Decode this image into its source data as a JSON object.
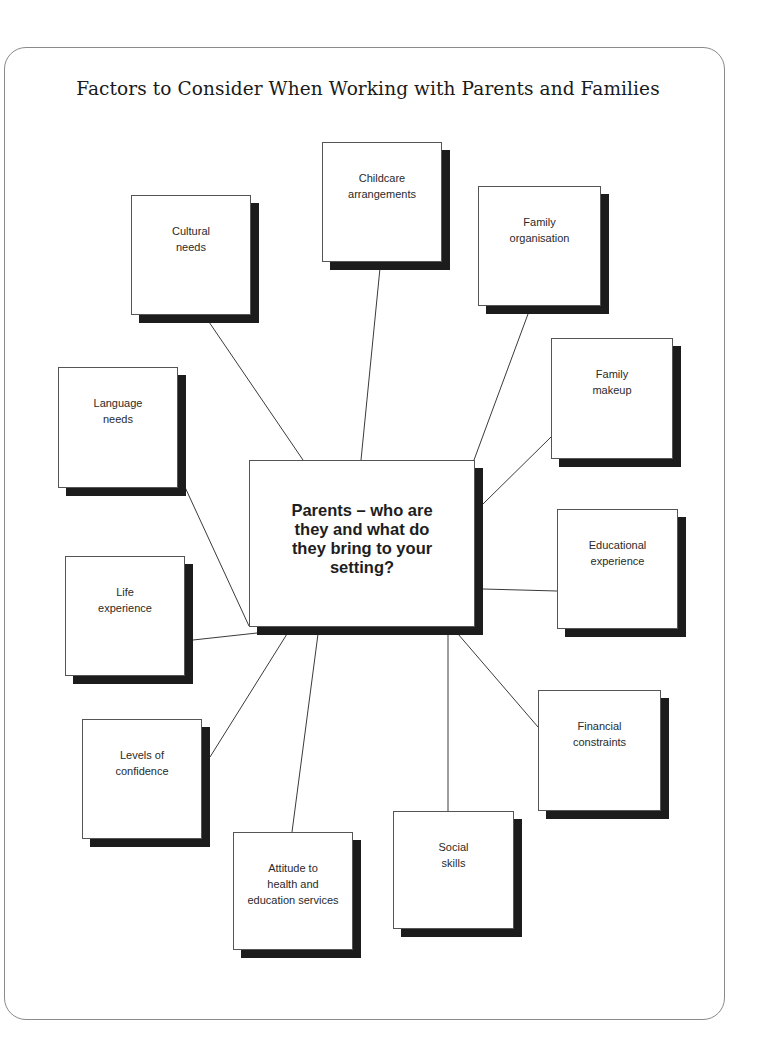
{
  "title": "Factors to Consider When Working with Parents and Families",
  "colors": {
    "line": "#3a3a3a",
    "shadow": "#1c1c1c",
    "frame": "#8a8a8a",
    "box_fill": "#ffffff"
  },
  "center": {
    "label": "Parents – who are\nthey and what do\nthey bring to your\nsetting?",
    "rect": [
      249,
      460,
      226,
      167
    ]
  },
  "factors": [
    {
      "id": "childcare-arrangements",
      "label": "Childcare\narrangements",
      "rect": [
        322,
        142,
        120,
        120
      ],
      "line": [
        380,
        268,
        361,
        460
      ]
    },
    {
      "id": "cultural-needs",
      "label": "Cultural\nneeds",
      "rect": [
        131,
        195,
        120,
        120
      ],
      "line": [
        209,
        322,
        303,
        460
      ]
    },
    {
      "id": "family-organisation",
      "label": "Family\norganisation",
      "rect": [
        478,
        186,
        123,
        120
      ],
      "line": [
        528,
        314,
        474,
        460
      ]
    },
    {
      "id": "language-needs",
      "label": "Language\nneeds",
      "rect": [
        58,
        367,
        120,
        121
      ],
      "line": [
        184,
        485,
        249,
        626
      ]
    },
    {
      "id": "family-makeup",
      "label": "Family\nmakeup",
      "rect": [
        551,
        338,
        122,
        121
      ],
      "line": [
        551,
        437,
        482,
        505
      ]
    },
    {
      "id": "educational-experience",
      "label": "Educational\nexperience",
      "rect": [
        557,
        509,
        121,
        120
      ],
      "line": [
        483,
        589,
        557,
        591
      ]
    },
    {
      "id": "life-experience",
      "label": "Life\nexperience",
      "rect": [
        65,
        556,
        120,
        120
      ],
      "line": [
        193,
        640,
        257,
        633
      ]
    },
    {
      "id": "levels-of-confidence",
      "label": "Levels of\nconfidence",
      "rect": [
        82,
        719,
        120,
        120
      ],
      "line": [
        287,
        634,
        210,
        757
      ]
    },
    {
      "id": "attitude-to-services",
      "label": "Attitude to\nhealth and\neducation services",
      "rect": [
        233,
        832,
        120,
        118
      ],
      "line": [
        318,
        634,
        292,
        832
      ]
    },
    {
      "id": "social-skills",
      "label": "Social\nskills",
      "rect": [
        393,
        811,
        121,
        118
      ],
      "line": [
        448,
        634,
        448,
        811
      ]
    },
    {
      "id": "financial-constraints",
      "label": "Financial\nconstraints",
      "rect": [
        538,
        690,
        123,
        121
      ],
      "line": [
        458,
        634,
        538,
        727
      ]
    }
  ]
}
